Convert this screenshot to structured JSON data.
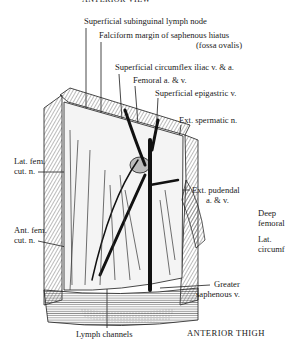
{
  "header": {
    "title": "ANTERIOR VIEW"
  },
  "footer": {
    "caption": "ANTERIOR THIGH"
  },
  "labels": {
    "subinguinal": "Superficial subinguinal lymph node",
    "falciform_1": "Falciform margin of saphenous hiatus",
    "falciform_2": "(fossa ovalis)",
    "circumflex": "Superficial circumflex iliac v. & a.",
    "femoral": "Femoral a. & v.",
    "epigastric": "Superficial epigastric v.",
    "spermatic": "Ext. spermatic n.",
    "lat_fem_1": "Lat. fem.",
    "lat_fem_2": "cut. n.",
    "pudendal_1": "Ext. pudendal",
    "pudendal_2": "a. & v.",
    "ant_fem_1": "Ant. fem.",
    "ant_fem_2": "cut. n.",
    "saphenous_1": "Greater",
    "saphenous_2": "saphenous v.",
    "lymph": "Lymph channels",
    "deep_1": "Deep",
    "deep_2": "femoral",
    "latcirc_1": "Lat.",
    "latcirc_2": "circumf"
  },
  "colors": {
    "ink": "#1a1a1a",
    "paper": "#ffffff",
    "hatch": "#555555"
  }
}
